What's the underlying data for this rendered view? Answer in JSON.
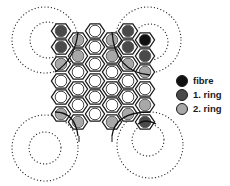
{
  "colors": {
    "fibre": "#111111",
    "ring1": "#4a4a4a",
    "ring2": "#a8a8a8",
    "empty": "#ffffff",
    "stroke": "#1a1a1a"
  },
  "legend": [
    {
      "key": "fibre",
      "label": "fibre"
    },
    {
      "key": "ring1",
      "label": "1. ring"
    },
    {
      "key": "ring2",
      "label": "2. ring"
    }
  ],
  "grid": {
    "columns": [
      {
        "x": 61,
        "cells": [
          {
            "y": 31,
            "type": "ring1"
          },
          {
            "y": 47,
            "type": "ring1"
          },
          {
            "y": 64,
            "type": "ring2"
          },
          {
            "y": 81,
            "type": "empty"
          },
          {
            "y": 97,
            "type": "empty"
          },
          {
            "y": 114,
            "type": "ring2"
          }
        ]
      },
      {
        "x": 78,
        "cells": [
          {
            "y": 40,
            "type": "ring2"
          },
          {
            "y": 56,
            "type": "ring2"
          },
          {
            "y": 72,
            "type": "empty"
          },
          {
            "y": 89,
            "type": "empty"
          },
          {
            "y": 105,
            "type": "empty"
          },
          {
            "y": 122,
            "type": "ring2"
          }
        ]
      },
      {
        "x": 95,
        "cells": [
          {
            "y": 31,
            "type": "empty"
          },
          {
            "y": 47,
            "type": "empty"
          },
          {
            "y": 64,
            "type": "empty"
          },
          {
            "y": 81,
            "type": "empty"
          },
          {
            "y": 97,
            "type": "empty"
          },
          {
            "y": 114,
            "type": "empty"
          }
        ]
      },
      {
        "x": 112,
        "cells": [
          {
            "y": 40,
            "type": "ring2"
          },
          {
            "y": 56,
            "type": "ring2"
          },
          {
            "y": 72,
            "type": "empty"
          },
          {
            "y": 89,
            "type": "empty"
          },
          {
            "y": 105,
            "type": "empty"
          },
          {
            "y": 122,
            "type": "ring2"
          }
        ]
      },
      {
        "x": 128,
        "cells": [
          {
            "y": 31,
            "type": "ring1"
          },
          {
            "y": 47,
            "type": "ring1"
          },
          {
            "y": 64,
            "type": "ring2"
          },
          {
            "y": 81,
            "type": "empty"
          },
          {
            "y": 97,
            "type": "empty"
          },
          {
            "y": 114,
            "type": "ring2"
          }
        ]
      },
      {
        "x": 145,
        "cells": [
          {
            "y": 40,
            "type": "fibre"
          },
          {
            "y": 56,
            "type": "ring1"
          },
          {
            "y": 72,
            "type": "ring2"
          },
          {
            "y": 89,
            "type": "empty"
          },
          {
            "y": 105,
            "type": "ring2"
          },
          {
            "y": 122,
            "type": "ring1"
          }
        ]
      }
    ]
  },
  "dotted_circles": [
    {
      "cx": 45,
      "cy": 40,
      "r": 33
    },
    {
      "cx": 48,
      "cy": 40,
      "r": 18
    },
    {
      "cx": 148,
      "cy": 40,
      "r": 33
    },
    {
      "cx": 150,
      "cy": 42,
      "r": 18
    },
    {
      "cx": 45,
      "cy": 148,
      "r": 33
    },
    {
      "cx": 45,
      "cy": 148,
      "r": 16
    },
    {
      "cx": 150,
      "cy": 145,
      "r": 33
    },
    {
      "cx": 148,
      "cy": 140,
      "r": 16
    }
  ],
  "arcs": [
    "M 55 72 Q 75 60 78 32",
    "M 112 32 Q 115 72 150 75",
    "M 55 112 Q 75 112 78 136",
    "M 112 136 Q 115 112 150 112",
    "M 138 124 Q 145 118 156 124"
  ],
  "ticks": [
    {
      "x": 79,
      "y1": 136,
      "y2": 142
    },
    {
      "x": 112,
      "y1": 136,
      "y2": 142
    }
  ]
}
